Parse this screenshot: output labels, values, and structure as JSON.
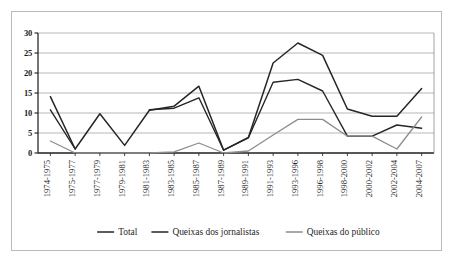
{
  "chart_data": {
    "type": "line",
    "title": "",
    "subtitle": "",
    "xlabel": "",
    "ylabel": "",
    "ylim": [
      0,
      30
    ],
    "ytick_values": [
      0,
      5,
      10,
      15,
      20,
      25,
      30
    ],
    "ytick_labels": [
      "0",
      "5",
      "10",
      "15",
      "20",
      "25",
      "30"
    ],
    "grid": true,
    "legend_position": "bottom",
    "categories": [
      "1974-1975",
      "1975-1977",
      "1977-1979",
      "1979-1981",
      "1981-1983",
      "1983-1985",
      "1985-1987",
      "1987-1989",
      "1989-1991",
      "1991-1993",
      "1993-1996",
      "1996-1998",
      "1998-2000",
      "2000-2002",
      "2002-2004",
      "2004-2007"
    ],
    "series": [
      {
        "name": "Total",
        "color": "#262626",
        "width": 1.5,
        "values": [
          14.1,
          1.0,
          9.8,
          1.9,
          10.7,
          11.7,
          16.7,
          0.7,
          3.9,
          22.5,
          27.5,
          24.4,
          11.0,
          9.2,
          9.2,
          16.1
        ]
      },
      {
        "name": "Queixas dos jornalistas",
        "color": "#262626",
        "width": 1.4,
        "values": [
          10.8,
          1.0,
          null,
          null,
          10.8,
          11.2,
          13.8,
          0.7,
          3.8,
          17.7,
          18.4,
          15.5,
          4.2,
          4.2,
          7.0,
          6.2
        ]
      },
      {
        "name": "Queixas do público",
        "color": "#8d8d8d",
        "width": 1.3,
        "values": [
          3.0,
          0.0,
          0.0,
          0.0,
          0.0,
          0.3,
          2.5,
          0.0,
          0.5,
          4.5,
          8.4,
          8.4,
          4.2,
          4.2,
          1.0,
          9.0
        ]
      }
    ]
  },
  "legend": {
    "items": [
      {
        "label": "Total",
        "color": "#262626"
      },
      {
        "label": "Queixas dos jornalistas",
        "color": "#262626"
      },
      {
        "label": "Queixas do público",
        "color": "#8d8d8d"
      }
    ]
  }
}
